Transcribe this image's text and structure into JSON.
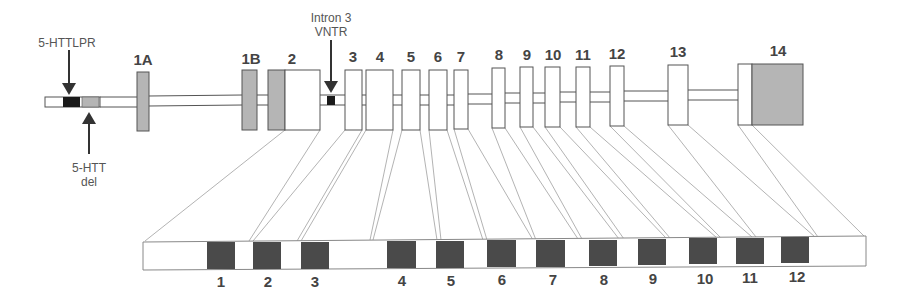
{
  "diagram": {
    "colors": {
      "outline": "#555555",
      "light_gray": "#b5b5b5",
      "dark_block": "#4a4a4a",
      "black": "#1a1a1a",
      "connector": "#9a9a9a"
    },
    "annotations": {
      "lpr": "5-HTTLPR",
      "del_line1": "5-HTT",
      "del_line2": "del",
      "vntr_line1": "Intron 3",
      "vntr_line2": "VNTR"
    },
    "gene_exons": [
      {
        "label": "1A",
        "x": 137,
        "w": 12,
        "y": 72,
        "h": 59,
        "fill": "gray"
      },
      {
        "label": "1B",
        "x": 242,
        "w": 15,
        "y": 70,
        "h": 60,
        "fill": "gray"
      },
      {
        "label": "2",
        "x": 268,
        "w": 52,
        "y": 70,
        "h": 60,
        "fill": "split",
        "gray_w": 17
      },
      {
        "label": "3",
        "x": 345,
        "w": 17,
        "y": 70,
        "h": 60,
        "fill": "white"
      },
      {
        "label": "4",
        "x": 366,
        "w": 27,
        "y": 70,
        "h": 60,
        "fill": "white"
      },
      {
        "label": "5",
        "x": 402,
        "w": 18,
        "y": 70,
        "h": 60,
        "fill": "white"
      },
      {
        "label": "6",
        "x": 429,
        "w": 18,
        "y": 70,
        "h": 60,
        "fill": "white"
      },
      {
        "label": "7",
        "x": 454,
        "w": 14,
        "y": 70,
        "h": 59,
        "fill": "white"
      },
      {
        "label": "8",
        "x": 492,
        "w": 13,
        "y": 68,
        "h": 60,
        "fill": "white"
      },
      {
        "label": "9",
        "x": 520,
        "w": 13,
        "y": 67,
        "h": 60,
        "fill": "white"
      },
      {
        "label": "10",
        "x": 545,
        "w": 15,
        "y": 67,
        "h": 60,
        "fill": "white"
      },
      {
        "label": "11",
        "x": 576,
        "w": 14,
        "y": 67,
        "h": 60,
        "fill": "white"
      },
      {
        "label": "12",
        "x": 610,
        "w": 14,
        "y": 66,
        "h": 60,
        "fill": "white"
      },
      {
        "label": "13",
        "x": 668,
        "w": 20,
        "y": 65,
        "h": 60,
        "fill": "white"
      },
      {
        "label": "14",
        "x": 738,
        "w": 65,
        "y": 64,
        "h": 61,
        "fill": "split14",
        "white_w": 14
      }
    ],
    "cds_blocks": [
      {
        "label": "1",
        "x": 207,
        "w": 28
      },
      {
        "label": "2",
        "x": 253,
        "w": 28
      },
      {
        "label": "3",
        "x": 301,
        "w": 28
      },
      {
        "label": "4",
        "x": 387,
        "w": 29
      },
      {
        "label": "5",
        "x": 436,
        "w": 28
      },
      {
        "label": "6",
        "x": 487,
        "w": 29
      },
      {
        "label": "7",
        "x": 536,
        "w": 29
      },
      {
        "label": "8",
        "x": 589,
        "w": 28
      },
      {
        "label": "9",
        "x": 638,
        "w": 28
      },
      {
        "label": "10",
        "x": 689,
        "w": 28
      },
      {
        "label": "11",
        "x": 736,
        "w": 28
      },
      {
        "label": "12",
        "x": 781,
        "w": 28
      }
    ]
  }
}
